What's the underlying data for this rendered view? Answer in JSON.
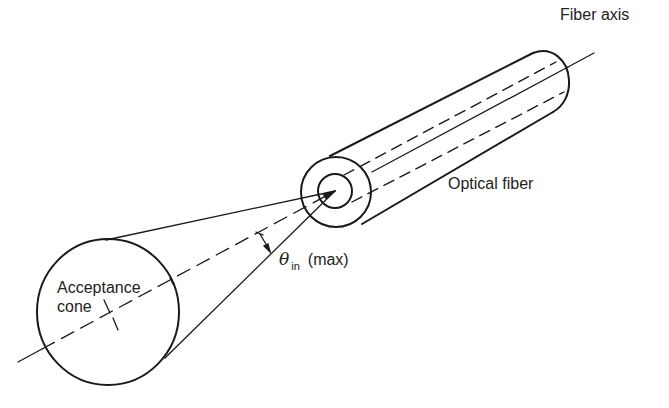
{
  "diagram": {
    "labels": {
      "fiber_axis": "Fiber axis",
      "optical_fiber": "Optical fiber",
      "acceptance_cone_line1": "Acceptance",
      "acceptance_cone_line2": "cone",
      "theta_symbol": "θ",
      "theta_subscript": "in",
      "theta_suffix": "(max)"
    },
    "colors": {
      "stroke": "#1a1a1a",
      "background": "#ffffff"
    }
  }
}
